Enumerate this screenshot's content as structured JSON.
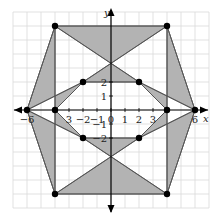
{
  "diagram": {
    "type": "coordinate-plane-figure",
    "axes": {
      "x_label": "x",
      "y_label": "y",
      "x_ticks": [
        {
          "value": -6,
          "label": "-6"
        },
        {
          "value": -3,
          "label": "3"
        },
        {
          "value": -2,
          "label": "-2"
        },
        {
          "value": -1,
          "label": "-1"
        },
        {
          "value": 0,
          "label": "0"
        },
        {
          "value": 1,
          "label": "1"
        },
        {
          "value": 2,
          "label": "2"
        },
        {
          "value": 3,
          "label": "3"
        },
        {
          "value": 6,
          "label": "6"
        }
      ],
      "y_ticks": [
        {
          "value": 2,
          "label": "2"
        },
        {
          "value": 1,
          "label": "1"
        },
        {
          "value": -1,
          "label": "-1"
        },
        {
          "value": -2,
          "label": "-2"
        }
      ],
      "x_range": [
        -7,
        7
      ],
      "y_range": [
        -7,
        7
      ],
      "grid": true
    },
    "points": [
      {
        "x": -4,
        "y": 6
      },
      {
        "x": 4,
        "y": 6
      },
      {
        "x": -6,
        "y": 0
      },
      {
        "x": 6,
        "y": 0
      },
      {
        "x": -4,
        "y": -6
      },
      {
        "x": 4,
        "y": -6
      },
      {
        "x": -2,
        "y": 2
      },
      {
        "x": 2,
        "y": 2
      },
      {
        "x": -4,
        "y": 0
      },
      {
        "x": 4,
        "y": 0
      },
      {
        "x": -2,
        "y": -2
      },
      {
        "x": 2,
        "y": -2
      }
    ],
    "shaded_regions": [
      {
        "name": "top-bowtie-upper",
        "vertices": [
          [
            -4,
            6
          ],
          [
            4,
            6
          ],
          [
            0,
            3.333
          ]
        ]
      },
      {
        "name": "top-bowtie-lower",
        "vertices": [
          [
            -2,
            2
          ],
          [
            2,
            2
          ],
          [
            0,
            3.333
          ]
        ]
      },
      {
        "name": "bottom-bowtie-lower",
        "vertices": [
          [
            -4,
            -6
          ],
          [
            4,
            -6
          ],
          [
            0,
            -3.333
          ]
        ]
      },
      {
        "name": "bottom-bowtie-upper",
        "vertices": [
          [
            -2,
            -2
          ],
          [
            2,
            -2
          ],
          [
            0,
            -3.333
          ]
        ]
      },
      {
        "name": "upper-left-outer",
        "vertices": [
          [
            -4,
            6
          ],
          [
            -6,
            0
          ],
          [
            -4,
            1
          ]
        ]
      },
      {
        "name": "upper-left-inner",
        "vertices": [
          [
            -4,
            1
          ],
          [
            -2,
            2
          ],
          [
            -4,
            0
          ]
        ]
      },
      {
        "name": "lower-left-outer",
        "vertices": [
          [
            -4,
            -6
          ],
          [
            -6,
            0
          ],
          [
            -4,
            -1
          ]
        ]
      },
      {
        "name": "lower-left-inner",
        "vertices": [
          [
            -4,
            -1
          ],
          [
            -2,
            -2
          ],
          [
            -4,
            0
          ]
        ]
      },
      {
        "name": "upper-right-outer",
        "vertices": [
          [
            4,
            6
          ],
          [
            6,
            0
          ],
          [
            4,
            1
          ]
        ]
      },
      {
        "name": "upper-right-inner",
        "vertices": [
          [
            4,
            1
          ],
          [
            2,
            2
          ],
          [
            4,
            0
          ]
        ]
      },
      {
        "name": "lower-right-outer",
        "vertices": [
          [
            4,
            -6
          ],
          [
            6,
            0
          ],
          [
            4,
            -1
          ]
        ]
      },
      {
        "name": "lower-right-inner",
        "vertices": [
          [
            4,
            -1
          ],
          [
            2,
            -2
          ],
          [
            4,
            0
          ]
        ]
      }
    ],
    "colors": {
      "shade": "#b3b3b3",
      "line": "#555555",
      "grid": "#d9d9d9",
      "point": "#000000"
    }
  }
}
